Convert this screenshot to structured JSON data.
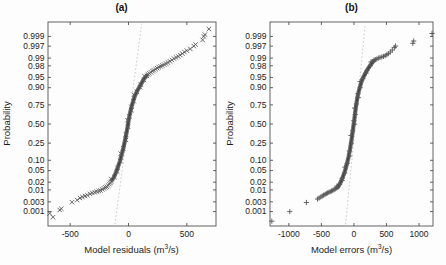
{
  "figure": {
    "background": "#fdfdfd"
  },
  "chart_data": [
    {
      "type": "scatter",
      "variant": "normal-probability-plot",
      "title": "(a)",
      "ylabel": "Probability",
      "xlabel_prefix": "Model residuals (m",
      "xlabel_sup": "3",
      "xlabel_suffix": "/s)",
      "marker": "x",
      "xlim": [
        -690,
        750
      ],
      "xtick_labels": [
        "-500",
        "0",
        "500"
      ],
      "ytick_labels": [
        "0.999",
        "0.997",
        "0.99",
        "0.98",
        "0.95",
        "0.90",
        "0.75",
        "0.50",
        "0.25",
        "0.10",
        "0.05",
        "0.02",
        "0.01",
        "0.003",
        "0.001"
      ],
      "grid": false,
      "legend": null,
      "reference_line": {
        "points": [
          [
            -116,
            0.0002
          ],
          [
            113,
            0.9998
          ]
        ],
        "color": "#bcbcbc",
        "style": "dashed"
      },
      "band_points": [
        [
          -140,
          0.024
        ],
        [
          -122,
          0.032
        ],
        [
          -106,
          0.045
        ],
        [
          -90,
          0.065
        ],
        [
          -74,
          0.095
        ],
        [
          -58,
          0.14
        ],
        [
          -44,
          0.2
        ],
        [
          -30,
          0.28
        ],
        [
          -18,
          0.37
        ],
        [
          -8,
          0.46
        ],
        [
          0,
          0.54
        ],
        [
          8,
          0.61
        ],
        [
          18,
          0.68
        ],
        [
          28,
          0.74
        ],
        [
          40,
          0.79
        ],
        [
          55,
          0.84
        ],
        [
          72,
          0.875
        ],
        [
          90,
          0.9
        ],
        [
          110,
          0.923
        ],
        [
          128,
          0.94
        ],
        [
          145,
          0.951
        ],
        [
          158,
          0.957
        ]
      ],
      "tail_points": [
        [
          -675,
          0.0008
        ],
        [
          -647,
          0.0005
        ],
        [
          -590,
          0.0012
        ],
        [
          -576,
          0.0014
        ],
        [
          -484,
          0.0029
        ],
        [
          -440,
          0.0036
        ],
        [
          -416,
          0.0045
        ],
        [
          -395,
          0.005
        ],
        [
          -373,
          0.0055
        ],
        [
          -352,
          0.006
        ],
        [
          -330,
          0.0068
        ],
        [
          -310,
          0.0075
        ],
        [
          -290,
          0.008
        ],
        [
          -272,
          0.0085
        ],
        [
          -255,
          0.009
        ],
        [
          -240,
          0.0095
        ],
        [
          -225,
          0.0105
        ],
        [
          -210,
          0.0115
        ],
        [
          -198,
          0.0125
        ],
        [
          -186,
          0.0135
        ],
        [
          -175,
          0.015
        ],
        [
          -165,
          0.017
        ],
        [
          -156,
          0.019
        ],
        [
          -148,
          0.021
        ],
        [
          168,
          0.96
        ],
        [
          180,
          0.963
        ],
        [
          192,
          0.966
        ],
        [
          205,
          0.969
        ],
        [
          218,
          0.971
        ],
        [
          232,
          0.9735
        ],
        [
          246,
          0.9755
        ],
        [
          260,
          0.9775
        ],
        [
          275,
          0.979
        ],
        [
          290,
          0.9805
        ],
        [
          306,
          0.982
        ],
        [
          322,
          0.9835
        ],
        [
          338,
          0.985
        ],
        [
          355,
          0.9865
        ],
        [
          372,
          0.988
        ],
        [
          390,
          0.9895
        ],
        [
          408,
          0.9905
        ],
        [
          426,
          0.9915
        ],
        [
          444,
          0.9925
        ],
        [
          462,
          0.9935
        ],
        [
          480,
          0.9945
        ],
        [
          500,
          0.9952
        ],
        [
          530,
          0.996
        ],
        [
          560,
          0.997
        ],
        [
          575,
          0.9975
        ],
        [
          635,
          0.9985
        ],
        [
          645,
          0.999
        ],
        [
          655,
          0.9992
        ],
        [
          689,
          0.9996
        ]
      ],
      "colors": {
        "marker": "#585858",
        "band": "#4a4a4a",
        "frame": "#3c3c3c",
        "text": "#1c1c1c"
      }
    },
    {
      "type": "scatter",
      "variant": "normal-probability-plot",
      "title": "(b)",
      "ylabel": "Probability",
      "xlabel_prefix": "Model errors (m",
      "xlabel_sup": "3",
      "xlabel_suffix": "/s)",
      "marker": "+",
      "xlim": [
        -1290,
        1215
      ],
      "xtick_labels": [
        "-1000",
        "-500",
        "0",
        "500",
        "1000"
      ],
      "ytick_labels": [
        "0.999",
        "0.997",
        "0.99",
        "0.98",
        "0.95",
        "0.90",
        "0.75",
        "0.50",
        "0.25",
        "0.10",
        "0.05",
        "0.02",
        "0.01",
        "0.003",
        "0.001"
      ],
      "grid": false,
      "legend": null,
      "reference_line": {
        "points": [
          [
            -130,
            0.0002
          ],
          [
            175,
            0.9998
          ]
        ],
        "color": "#bcbcbc",
        "style": "dashed"
      },
      "band_points": [
        [
          -246,
          0.013
        ],
        [
          -220,
          0.017
        ],
        [
          -196,
          0.022
        ],
        [
          -172,
          0.03
        ],
        [
          -148,
          0.042
        ],
        [
          -125,
          0.06
        ],
        [
          -103,
          0.085
        ],
        [
          -82,
          0.125
        ],
        [
          -62,
          0.18
        ],
        [
          -45,
          0.25
        ],
        [
          -30,
          0.33
        ],
        [
          -17,
          0.41
        ],
        [
          -5,
          0.49
        ],
        [
          5,
          0.56
        ],
        [
          15,
          0.63
        ],
        [
          26,
          0.7
        ],
        [
          38,
          0.765
        ],
        [
          52,
          0.82
        ],
        [
          68,
          0.865
        ],
        [
          88,
          0.9
        ],
        [
          112,
          0.928
        ],
        [
          140,
          0.948
        ],
        [
          172,
          0.962
        ],
        [
          208,
          0.973
        ],
        [
          246,
          0.98
        ],
        [
          278,
          0.9845
        ],
        [
          300,
          0.987
        ]
      ],
      "tail_points": [
        [
          -1262,
          0.0003
        ],
        [
          -985,
          0.001
        ],
        [
          -730,
          0.0028
        ],
        [
          -560,
          0.004
        ],
        [
          -535,
          0.0045
        ],
        [
          -510,
          0.005
        ],
        [
          -488,
          0.0055
        ],
        [
          -466,
          0.006
        ],
        [
          -445,
          0.0065
        ],
        [
          -425,
          0.007
        ],
        [
          -405,
          0.0075
        ],
        [
          -385,
          0.008
        ],
        [
          -365,
          0.0085
        ],
        [
          -345,
          0.009
        ],
        [
          -325,
          0.0095
        ],
        [
          -305,
          0.0103
        ],
        [
          -288,
          0.011
        ],
        [
          -272,
          0.0118
        ],
        [
          -258,
          0.0125
        ],
        [
          310,
          0.988
        ],
        [
          330,
          0.9885
        ],
        [
          352,
          0.989
        ],
        [
          375,
          0.99
        ],
        [
          400,
          0.9905
        ],
        [
          428,
          0.991
        ],
        [
          455,
          0.9915
        ],
        [
          480,
          0.992
        ],
        [
          505,
          0.9928
        ],
        [
          530,
          0.9935
        ],
        [
          560,
          0.9945
        ],
        [
          590,
          0.9955
        ],
        [
          620,
          0.9965
        ],
        [
          640,
          0.997
        ],
        [
          905,
          0.9978
        ],
        [
          918,
          0.9983
        ],
        [
          1200,
          0.9993
        ]
      ],
      "colors": {
        "marker": "#585858",
        "band": "#4a4a4a",
        "frame": "#3c3c3c",
        "text": "#1c1c1c"
      }
    }
  ]
}
